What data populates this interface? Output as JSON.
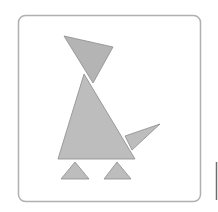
{
  "figure": {
    "frame": {
      "x": 18.5,
      "y": 15.5,
      "width": 182,
      "height": 186,
      "radius": 7,
      "stroke": "#b0b0b0",
      "fill": "#ffffff"
    },
    "colors": {
      "shape_fill": "#bdbdbd",
      "head_fill": "#b4b4b4",
      "shape_stroke": "#8c8c8c",
      "edge_line": "#6e6e6e"
    },
    "shapes": [
      {
        "name": "head",
        "points": "64,36 113,47 93,83"
      },
      {
        "name": "body",
        "points": "84,74 58,159 135,159"
      },
      {
        "name": "tail",
        "points": "125,136 160,124 132,150"
      },
      {
        "name": "left-foot",
        "points": "61,179 75,162 89,179"
      },
      {
        "name": "right-foot",
        "points": "104,179 117,162 131,179"
      }
    ],
    "edge_line": {
      "x1": 216.5,
      "y1": 162,
      "x2": 216.5,
      "y2": 200
    }
  }
}
